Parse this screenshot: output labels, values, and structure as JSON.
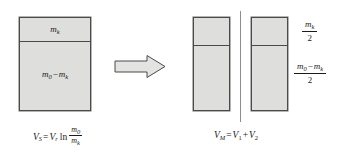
{
  "figure": {
    "background_color": "#ffffff",
    "box_fill_color": "#dededc",
    "box_border_color": "#4a4a4a",
    "text_color": "#1b1b1b"
  },
  "left_stage": {
    "name": "single-stage-rocket",
    "upper_compartment_label": "m",
    "upper_compartment_sub": "k",
    "lower_compartment_label_first": "m",
    "lower_compartment_sub_first": "0",
    "lower_compartment_minus": "−",
    "lower_compartment_label_second": "m",
    "lower_compartment_sub_second": "k"
  },
  "arrow": {
    "name": "transformation-arrow",
    "direction": "right",
    "fill_color": "#e3e3e1",
    "stroke_color": "#4a4a4a"
  },
  "right_stage": {
    "name": "two-stage-rocket",
    "separator_color": "#8d8d8d",
    "boxes": [
      {
        "label": "stage-1"
      },
      {
        "label": "stage-2"
      }
    ],
    "labels": {
      "top_fraction_numerator": "m",
      "top_fraction_numerator_sub": "k",
      "top_fraction_denominator": "2",
      "bottom_fraction_numerator_first": "m",
      "bottom_fraction_numerator_sub_first": "0",
      "bottom_fraction_minus": "−",
      "bottom_fraction_numerator_second": "m",
      "bottom_fraction_numerator_sub_second": "k",
      "bottom_fraction_denominator": "2"
    }
  },
  "equations": {
    "left": {
      "name": "single-stage-velocity-equation",
      "lhs_var": "V",
      "lhs_sub": "S",
      "equals": "=",
      "rhs_var": "V",
      "rhs_sub": "r",
      "function": "ln",
      "fraction_numerator": "m",
      "fraction_numerator_sub": "0",
      "fraction_denominator": "m",
      "fraction_denominator_sub": "k"
    },
    "right": {
      "name": "multi-stage-velocity-equation",
      "lhs_var": "V",
      "lhs_sub": "M",
      "equals": "=",
      "term1_var": "V",
      "term1_sub": "1",
      "plus": "+",
      "term2_var": "V",
      "term2_sub": "2"
    }
  }
}
